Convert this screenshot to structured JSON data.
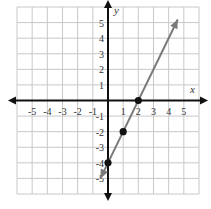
{
  "chart_data": {
    "type": "line",
    "title": "",
    "xlabel": "x",
    "ylabel": "y",
    "xlim": [
      -6,
      6
    ],
    "ylim": [
      -6,
      6
    ],
    "grid": true,
    "x_ticks": [
      "-5",
      "-4",
      "-3",
      "-2",
      "-1",
      "1",
      "2",
      "3",
      "4",
      "5"
    ],
    "y_ticks": [
      "5",
      "4",
      "3",
      "2",
      "1",
      "-1",
      "-2",
      "-3",
      "-4",
      "-5"
    ],
    "series": [
      {
        "name": "y = 2x - 4",
        "line_endpoints": [
          [
            -0.5,
            -5.0
          ],
          [
            4.6,
            5.2
          ]
        ],
        "points": [
          [
            0,
            -4
          ],
          [
            1,
            -2
          ],
          [
            2,
            0
          ]
        ],
        "color": "#7a7a7a"
      }
    ]
  },
  "colors": {
    "grid": "#c8c8c8",
    "axis": "#111111",
    "line": "#7a7a7a",
    "point": "#111111"
  }
}
